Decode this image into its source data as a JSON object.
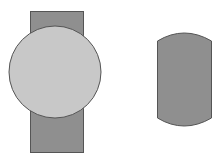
{
  "diagram": {
    "background": "#ffffff",
    "stroke": "#555555",
    "shapes": {
      "left_rect": {
        "x": 30,
        "y": 11,
        "w": 53,
        "h": 141,
        "fill": "#8f8f8f"
      },
      "left_circle": {
        "cx": 55,
        "cy": 72,
        "r": 46,
        "fill": "#c8c8c8"
      },
      "right_shape": {
        "x": 157,
        "y": 33,
        "w": 54,
        "h": 93,
        "fill": "#8f8f8f"
      }
    }
  }
}
